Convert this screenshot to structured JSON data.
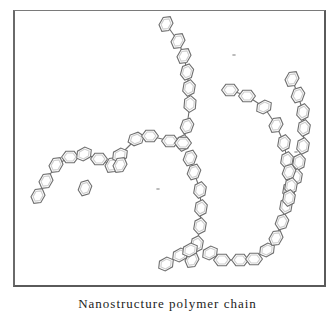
{
  "figure": {
    "caption": "Nanostructure polymer chain",
    "colors": {
      "ring_stroke": "#6f6f6f",
      "frame": "#5a5a5a",
      "background": "#ffffff"
    },
    "ring_radius": 8,
    "chains": [
      {
        "name": "top-left-arm",
        "rings": [
          [
            166,
            24,
            -60
          ],
          [
            178,
            41,
            -60
          ],
          [
            184,
            56,
            -60
          ],
          [
            187,
            72,
            -75
          ],
          [
            189,
            88,
            -80
          ],
          [
            190,
            104,
            -85
          ],
          [
            187,
            126,
            -70
          ],
          [
            183,
            143,
            -80
          ]
        ]
      },
      {
        "name": "left-arc",
        "rings": [
          [
            38,
            196,
            -60
          ],
          [
            46,
            181,
            -60
          ],
          [
            56,
            165,
            -60
          ],
          [
            70,
            157,
            0
          ],
          [
            84,
            154,
            -30
          ],
          [
            99,
            159,
            0
          ],
          [
            112,
            165,
            -60
          ],
          [
            120,
            155,
            -30
          ],
          [
            136,
            139,
            -20
          ],
          [
            150,
            136,
            0
          ],
          [
            170,
            141,
            0
          ],
          [
            183,
            143,
            0
          ]
        ]
      },
      {
        "name": "left-stray",
        "rings": [
          [
            85,
            188,
            -70
          ]
        ]
      },
      {
        "name": "left-branch-drop",
        "rings": [
          [
            120,
            165,
            -60
          ]
        ]
      },
      {
        "name": "center-down",
        "rings": [
          [
            190,
            158,
            -70
          ],
          [
            194,
            172,
            -70
          ],
          [
            200,
            190,
            -80
          ],
          [
            201,
            208,
            -80
          ],
          [
            200,
            226,
            -80
          ],
          [
            197,
            244,
            -80
          ],
          [
            192,
            260,
            -60
          ]
        ]
      },
      {
        "name": "bottom-left",
        "rings": [
          [
            166,
            264,
            -30
          ],
          [
            180,
            255,
            -30
          ],
          [
            190,
            250,
            -30
          ]
        ]
      },
      {
        "name": "bottom-arc",
        "rings": [
          [
            210,
            253,
            -30
          ],
          [
            222,
            260,
            0
          ],
          [
            240,
            260,
            0
          ],
          [
            254,
            259,
            0
          ],
          [
            267,
            250,
            -30
          ],
          [
            276,
            238,
            -60
          ],
          [
            282,
            222,
            -70
          ],
          [
            286,
            206,
            -80
          ],
          [
            289,
            190,
            -80
          ]
        ]
      },
      {
        "name": "right-upper",
        "rings": [
          [
            292,
            79,
            -60
          ],
          [
            298,
            95,
            -70
          ],
          [
            303,
            112,
            -80
          ],
          [
            304,
            128,
            -80
          ],
          [
            303,
            146,
            -80
          ],
          [
            299,
            162,
            -80
          ],
          [
            296,
            177,
            -80
          ]
        ]
      },
      {
        "name": "right-middle",
        "rings": [
          [
            230,
            90,
            0
          ],
          [
            247,
            96,
            0
          ],
          [
            264,
            107,
            -30
          ],
          [
            276,
            125,
            -60
          ],
          [
            284,
            143,
            -80
          ],
          [
            287,
            160,
            -80
          ]
        ]
      },
      {
        "name": "right-drop",
        "rings": [
          [
            289,
            172,
            -70
          ],
          [
            291,
            186,
            -80
          ],
          [
            289,
            198,
            -80
          ]
        ]
      }
    ],
    "specks": [
      [
        234,
        55
      ],
      [
        158,
        189
      ],
      [
        296,
        152
      ],
      [
        125,
        300
      ]
    ]
  }
}
